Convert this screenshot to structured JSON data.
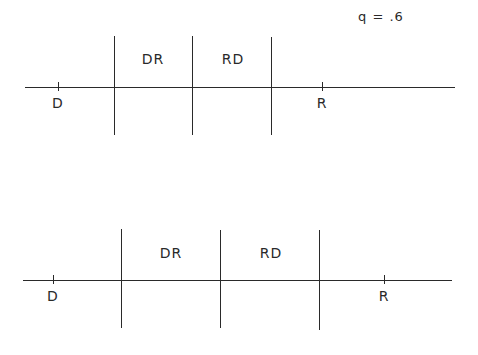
{
  "parameter_label": "q = .6",
  "diagrams": [
    {
      "name": "top",
      "axis": {
        "y": 87,
        "x_start": 25,
        "x_end": 455
      },
      "dividers": [
        {
          "x": 114,
          "y_start": 36,
          "y_end": 135
        },
        {
          "x": 192,
          "y_start": 36,
          "y_end": 135
        },
        {
          "x": 271,
          "y_start": 37,
          "y_end": 135
        }
      ],
      "points": [
        {
          "label": "D",
          "x": 58
        },
        {
          "label": "R",
          "x": 322
        }
      ],
      "regions": [
        {
          "label": "DR",
          "x": 153,
          "y": 52
        },
        {
          "label": "RD",
          "x": 233,
          "y": 52
        }
      ]
    },
    {
      "name": "bottom",
      "axis": {
        "y": 280,
        "x_start": 23,
        "x_end": 452
      },
      "dividers": [
        {
          "x": 121,
          "y_start": 229,
          "y_end": 328
        },
        {
          "x": 220,
          "y_start": 230,
          "y_end": 328
        },
        {
          "x": 319,
          "y_start": 230,
          "y_end": 330
        }
      ],
      "points": [
        {
          "label": "D",
          "x": 53
        },
        {
          "label": "R",
          "x": 384
        }
      ],
      "regions": [
        {
          "label": "DR",
          "x": 171,
          "y": 246
        },
        {
          "label": "RD",
          "x": 271,
          "y": 246
        }
      ]
    }
  ]
}
